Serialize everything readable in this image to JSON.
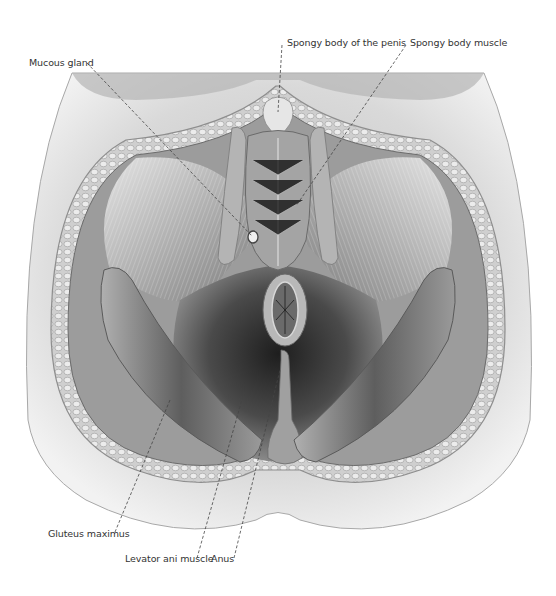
{
  "figure": {
    "style": "grayscale anatomical pencil illustration"
  },
  "labels": {
    "mucous_gland": "Mucous gland",
    "spongy_body_penis": "Spongy body of the penis",
    "spongy_body_muscle": "Spongy body muscle",
    "gluteus_maximus": "Gluteus maximus",
    "levator_ani": "Levator ani muscle",
    "anus": "Anus"
  },
  "colors": {
    "background": "#ffffff",
    "label_text": "#333333",
    "leader_line": "#444444",
    "skin": "#d8d8d8",
    "fat": "#c4c4c4",
    "muscle": "#8a8a8a",
    "deep_shadow": "#2e2e2e"
  }
}
